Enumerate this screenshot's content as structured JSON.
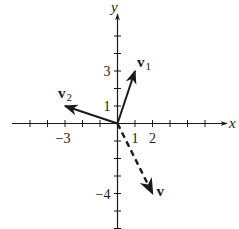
{
  "diagram": {
    "type": "vector-plane",
    "origin_px": [
      117.5,
      123.5
    ],
    "unit_px": 17.5,
    "axes": {
      "x_label": "x",
      "y_label": "y",
      "x_ticks": [
        -5,
        -4,
        -3,
        -2,
        -1,
        1,
        2,
        3,
        4,
        5
      ],
      "y_ticks": [
        -6,
        -5,
        -4,
        -3,
        -2,
        -1,
        1,
        2,
        3,
        4,
        5
      ],
      "x_tick_labels": [
        {
          "value": -3,
          "text": "−3"
        },
        {
          "value": 1,
          "text": "1"
        },
        {
          "value": 2,
          "text": "2"
        }
      ],
      "y_tick_labels": [
        {
          "value": 3,
          "text": "3"
        },
        {
          "value": 1,
          "text": "1"
        },
        {
          "value": -4,
          "text": "−4"
        }
      ]
    },
    "vectors": [
      {
        "name": "v1",
        "label": "v",
        "subscript": "1",
        "x": 1,
        "y": 3,
        "style": "solid"
      },
      {
        "name": "v2",
        "label": "v",
        "subscript": "2",
        "x": -3,
        "y": 1,
        "style": "solid"
      },
      {
        "name": "v",
        "label": "v",
        "subscript": "",
        "x": 2,
        "y": -4,
        "style": "dashed"
      }
    ],
    "colors": {
      "ink": "#1a1a1a",
      "background": "#ffffff"
    }
  }
}
